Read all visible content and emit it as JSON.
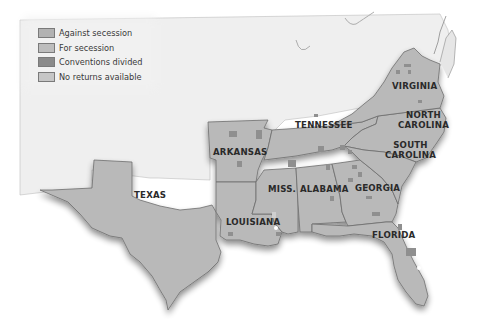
{
  "legend": {
    "items": [
      {
        "label": "Against secession",
        "color": "#b2b2b2"
      },
      {
        "label": "For secession",
        "color": "#bdbdbd"
      },
      {
        "label": "Conventions divided",
        "color": "#8a8a8a"
      },
      {
        "label": "No returns available",
        "color": "#c6c6c6"
      }
    ]
  },
  "colors": {
    "state_fill": "#b9b9b9",
    "state_border": "#6d6d6d",
    "conventions_divided": "#8f8f8f",
    "background": "#ffffff",
    "non_confederate_land": "#efefef",
    "label_text": "#2a2a2a"
  },
  "states": [
    {
      "name": "TEXAS"
    },
    {
      "name": "ARKANSAS"
    },
    {
      "name": "LOUISIANA"
    },
    {
      "name": "MISS."
    },
    {
      "name": "ALABAMA"
    },
    {
      "name": "GEORGIA"
    },
    {
      "name": "FLORIDA"
    },
    {
      "name": "TENNESSEE"
    },
    {
      "name": "SOUTH",
      "name2": "CAROLINA"
    },
    {
      "name": "NORTH",
      "name2": "CAROLINA"
    },
    {
      "name": "VIRGINIA"
    }
  ]
}
